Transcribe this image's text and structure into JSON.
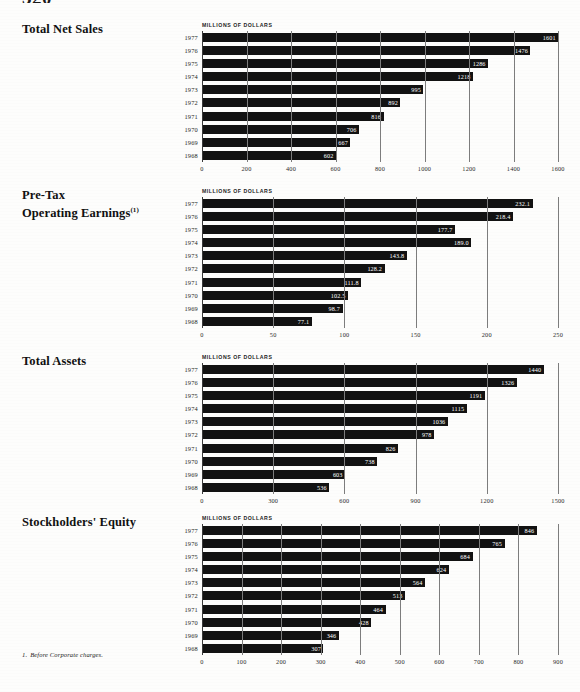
{
  "page": {
    "number": "320",
    "footnote_marker": "1.",
    "footnote_text": "Before Corporate charges."
  },
  "units_label": "MILLIONS OF DOLLARS",
  "years": [
    "1977",
    "1976",
    "1975",
    "1974",
    "1973",
    "1972",
    "1971",
    "1970",
    "1969",
    "1968"
  ],
  "charts": [
    {
      "id": "total-net-sales",
      "title": "Total Net Sales",
      "footnote_marker": "",
      "chart_data": {
        "type": "bar",
        "orientation": "horizontal",
        "title": "Total Net Sales",
        "xlabel": "MILLIONS OF DOLLARS",
        "ylabel": "",
        "categories": [
          "1977",
          "1976",
          "1975",
          "1974",
          "1973",
          "1972",
          "1971",
          "1970",
          "1969",
          "1968"
        ],
        "values": [
          1601,
          1476,
          1286,
          1218,
          995,
          892,
          816,
          706,
          667,
          602
        ],
        "value_labels": [
          "1601",
          "1476",
          "1286",
          "1218",
          "995",
          "892",
          "816",
          "706",
          "667",
          "602"
        ],
        "xlim": [
          0,
          1600
        ],
        "ticks": [
          0,
          200,
          400,
          600,
          800,
          1000,
          1200,
          1400,
          1600
        ],
        "tick_labels": [
          "0",
          "200",
          "400",
          "600",
          "800",
          "1000",
          "1200",
          "1400",
          "1600"
        ],
        "grid": true,
        "legend": "none"
      }
    },
    {
      "id": "pre-tax-operating-earnings",
      "title": "Pre-Tax\nOperating Earnings",
      "title_line1": "Pre-Tax",
      "title_line2": "Operating Earnings",
      "footnote_marker": "(1)",
      "chart_data": {
        "type": "bar",
        "orientation": "horizontal",
        "title": "Pre-Tax Operating Earnings (1)",
        "xlabel": "MILLIONS OF DOLLARS",
        "ylabel": "",
        "categories": [
          "1977",
          "1976",
          "1975",
          "1974",
          "1973",
          "1972",
          "1971",
          "1970",
          "1969",
          "1968"
        ],
        "values": [
          232.1,
          218.4,
          177.7,
          189.0,
          143.8,
          128.2,
          111.8,
          102.5,
          98.7,
          77.1
        ],
        "value_labels": [
          "232.1",
          "218.4",
          "177.7",
          "189.0",
          "143.8",
          "128.2",
          "111.8",
          "102.5",
          "98.7",
          "77.1"
        ],
        "xlim": [
          0,
          250
        ],
        "ticks": [
          0,
          50,
          100,
          150,
          200,
          250
        ],
        "tick_labels": [
          "0",
          "50",
          "100",
          "150",
          "200",
          "250"
        ],
        "grid": true,
        "legend": "none"
      }
    },
    {
      "id": "total-assets",
      "title": "Total Assets",
      "footnote_marker": "",
      "chart_data": {
        "type": "bar",
        "orientation": "horizontal",
        "title": "Total Assets",
        "xlabel": "MILLIONS OF DOLLARS",
        "ylabel": "",
        "categories": [
          "1977",
          "1976",
          "1975",
          "1974",
          "1973",
          "1972",
          "1971",
          "1970",
          "1969",
          "1968"
        ],
        "values": [
          1440,
          1326,
          1191,
          1115,
          1036,
          978,
          826,
          738,
          603,
          536
        ],
        "value_labels": [
          "1440",
          "1326",
          "1191",
          "1115",
          "1036",
          "978",
          "826",
          "738",
          "603",
          "536"
        ],
        "xlim": [
          0,
          1500
        ],
        "ticks": [
          0,
          300,
          600,
          900,
          1200,
          1500
        ],
        "tick_labels": [
          "0",
          "300",
          "600",
          "900",
          "1200",
          "1500"
        ],
        "grid": true,
        "legend": "none"
      }
    },
    {
      "id": "stockholders-equity",
      "title": "Stockholders' Equity",
      "footnote_marker": "",
      "chart_data": {
        "type": "bar",
        "orientation": "horizontal",
        "title": "Stockholders' Equity",
        "xlabel": "MILLIONS OF DOLLARS",
        "ylabel": "",
        "categories": [
          "1977",
          "1976",
          "1975",
          "1974",
          "1973",
          "1972",
          "1971",
          "1970",
          "1969",
          "1968"
        ],
        "values": [
          846,
          765,
          684,
          624,
          564,
          513,
          464,
          428,
          346,
          307
        ],
        "value_labels": [
          "846",
          "765",
          "684",
          "624",
          "564",
          "513",
          "464",
          "428",
          "346",
          "307"
        ],
        "xlim": [
          0,
          900
        ],
        "ticks": [
          0,
          100,
          200,
          300,
          400,
          500,
          600,
          700,
          800,
          900
        ],
        "tick_labels": [
          "0",
          "100",
          "200",
          "300",
          "400",
          "500",
          "600",
          "700",
          "800",
          "900"
        ],
        "grid": true,
        "legend": "none"
      }
    }
  ]
}
